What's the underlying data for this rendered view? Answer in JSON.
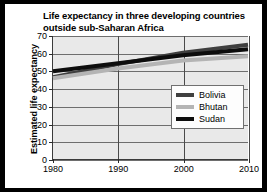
{
  "figure": {
    "title_line1": "Life expectancy in three developing countries",
    "title_line2": "outside sub-Saharan Africa",
    "frame_color": "#000000",
    "background": "#ffffff",
    "plot_background": "#e9e9e9"
  },
  "axes": {
    "y_title": "Estimated life expectancy",
    "y_ticks": [
      "0",
      "10",
      "20",
      "30",
      "40",
      "50",
      "60",
      "70"
    ],
    "x_ticks": [
      "1980",
      "1990",
      "2000",
      "2010"
    ]
  },
  "legend": {
    "items": [
      {
        "label": "Bolivia",
        "color": "#3f3f3f"
      },
      {
        "label": "Bhutan",
        "color": "#b4b4b4"
      },
      {
        "label": "Sudan",
        "color": "#0d0d0d"
      }
    ]
  },
  "chart_data": {
    "type": "line",
    "title": "Life expectancy in three developing countries outside sub-Saharan Africa",
    "xlabel": "",
    "ylabel": "Estimated life expectancy",
    "xlim": [
      1980,
      2010
    ],
    "ylim": [
      0,
      70
    ],
    "xticks": [
      1980,
      1990,
      2000,
      2010
    ],
    "yticks": [
      0,
      10,
      20,
      30,
      40,
      50,
      60,
      70
    ],
    "grid": true,
    "legend_position": "lower-right-inside",
    "x": [
      1980,
      1990,
      2000,
      2010
    ],
    "series": [
      {
        "name": "Bolivia",
        "color": "#3f3f3f",
        "values": [
          46.5,
          54.0,
          60.5,
          65.0
        ]
      },
      {
        "name": "Bhutan",
        "color": "#b4b4b4",
        "values": [
          46.0,
          51.5,
          56.0,
          58.5
        ]
      },
      {
        "name": "Sudan",
        "color": "#0d0d0d",
        "values": [
          50.0,
          54.5,
          59.0,
          62.5
        ]
      }
    ]
  }
}
